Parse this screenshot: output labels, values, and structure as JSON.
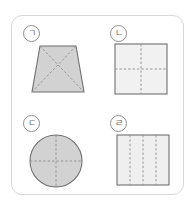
{
  "card": {
    "border_color": "#d8d8d8",
    "background": "#ffffff"
  },
  "palette": {
    "fill_dark": "#d2d2d2",
    "fill_light": "#f1f1f1",
    "fill_light_alt": "#efefef",
    "stroke": "#6f6f6f",
    "dash": "#9a9a9a",
    "label_text": "#6a6a6a",
    "label_border": "#8f8f8f"
  },
  "items": [
    {
      "label": "ㄱ",
      "label_name": "label-giyeok",
      "shape": "trapezoid",
      "shape_name": "trapezoid-figure",
      "fill": "#d2d2d2",
      "divisions": 4,
      "division_type": "diagonals",
      "dash_lines": 2
    },
    {
      "label": "ㄴ",
      "label_name": "label-nieun",
      "shape": "square",
      "shape_name": "square-quartered-figure",
      "fill": "#f1f1f1",
      "divisions": 4,
      "division_type": "cross",
      "dash_lines": 2
    },
    {
      "label": "ㄷ",
      "label_name": "label-digeut",
      "shape": "circle",
      "shape_name": "circle-quartered-figure",
      "fill": "#d2d2d2",
      "divisions": 4,
      "division_type": "cross",
      "dash_lines": 2
    },
    {
      "label": "ㄹ",
      "label_name": "label-rieul",
      "shape": "square",
      "shape_name": "square-striped-figure",
      "fill": "#efefef",
      "divisions": 4,
      "division_type": "vertical-strips",
      "dash_lines": 3
    }
  ]
}
